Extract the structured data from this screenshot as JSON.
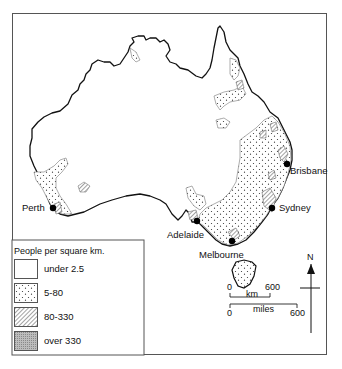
{
  "map": {
    "title": "Population density of Australia",
    "cities": [
      {
        "name": "Perth",
        "x": 53,
        "y": 208,
        "label_x": 22,
        "label_y": 203
      },
      {
        "name": "Adelaide",
        "x": 197,
        "y": 221,
        "label_x": 167,
        "label_y": 230
      },
      {
        "name": "Melbourne",
        "x": 232,
        "y": 241,
        "label_x": 199,
        "label_y": 250
      },
      {
        "name": "Sydney",
        "x": 272,
        "y": 208,
        "label_x": 279,
        "label_y": 203
      },
      {
        "name": "Brisbane",
        "x": 287,
        "y": 164,
        "label_x": 290,
        "label_y": 166
      }
    ]
  },
  "legend": {
    "title": "People per square km.",
    "items": [
      {
        "label": "under 2.5",
        "pattern": "blank"
      },
      {
        "label": "5-80",
        "pattern": "dots"
      },
      {
        "label": "80-330",
        "pattern": "hatch"
      },
      {
        "label": "over 330",
        "pattern": "dense"
      }
    ]
  },
  "scale": {
    "km": {
      "unit": "km",
      "start": "0",
      "end": "600"
    },
    "miles": {
      "unit": "miles",
      "start": "0",
      "end": "600"
    }
  },
  "north": {
    "label": "N"
  },
  "colors": {
    "line": "#111111",
    "frame": "#555555",
    "background": "#ffffff"
  }
}
